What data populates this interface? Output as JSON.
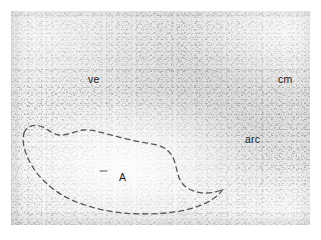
{
  "figure": {
    "kind": "histology-micrograph",
    "page_background": "#ffffff",
    "plate_background": "#f7f7f6",
    "plate": {
      "x": 11,
      "y": 11,
      "width": 299,
      "height": 214
    }
  },
  "labels": [
    {
      "id": "ve",
      "text": "ve",
      "x": 77,
      "y": 63,
      "color": "#1b1b1b",
      "font_size": 10.5
    },
    {
      "id": "cm",
      "text": "cm",
      "x": 267,
      "y": 63,
      "color": "#1b1b1b",
      "font_size": 10.5
    },
    {
      "id": "arc",
      "text": "arc",
      "x": 234,
      "y": 123,
      "color": "#1b1b1b",
      "font_size": 10.5
    },
    {
      "id": "A",
      "text": "A",
      "x": 108,
      "y": 161,
      "color": "#1b1b1b",
      "font_size": 10.5
    }
  ],
  "annotations": {
    "outline": {
      "id": "nucleus-outline",
      "style": "dashed",
      "stroke": "#565656",
      "stroke_width": 1.3,
      "dash_pattern": "5 4",
      "closed": true,
      "path": "M 13 122 C 15 116, 22 113, 29 115 C 36 117, 41 123, 48 124 C 56 125, 64 120, 72 119 C 80 118, 88 121, 96 123 C 104 125, 112 127, 120 129 C 128 131, 137 132, 146 134 C 154 136, 160 141, 163 149 C 166 157, 166 165, 171 172 C 176 179, 186 182, 196 182 C 203 182, 208 180, 212 178 C 207 186, 197 192, 185 196 C 170 201, 152 203, 133 203 C 112 203, 92 200, 74 194 C 58 189, 44 181, 33 170 C 23 160, 16 148, 13 136 C 12 131, 12 126, 13 122 Z"
    },
    "leader": {
      "id": "label-A-leader",
      "stroke": "#565656",
      "stroke_width": 1.1,
      "x1": 89,
      "y1": 160,
      "x2": 96,
      "y2": 160
    }
  },
  "icon_names": {
    "outline": "dashed-region-outline",
    "leader": "leader-line"
  }
}
